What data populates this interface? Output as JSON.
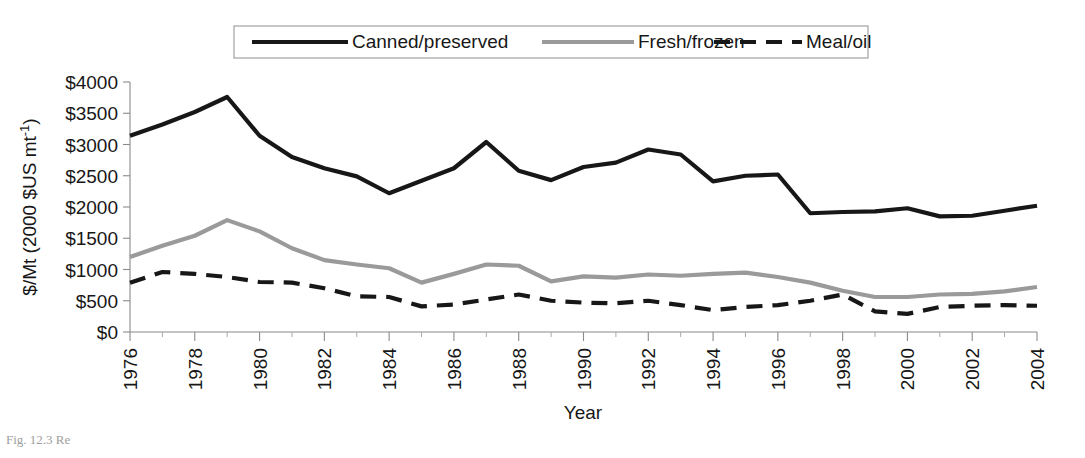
{
  "figure": {
    "caption_fragment": "Fig. 12.3  Re",
    "background": "#ffffff"
  },
  "chart_data": {
    "type": "line",
    "title": "",
    "xlabel": "Year",
    "ylabel": "$/Mt (2000 $US mt⁻¹)",
    "ylabel_parts": {
      "prefix": "$/Mt (2000 $US mt",
      "superscript": "-1",
      "suffix": ")"
    },
    "x": [
      1976,
      1977,
      1978,
      1979,
      1980,
      1981,
      1982,
      1983,
      1984,
      1985,
      1986,
      1987,
      1988,
      1989,
      1990,
      1991,
      1992,
      1993,
      1994,
      1995,
      1996,
      1997,
      1998,
      1999,
      2000,
      2001,
      2002,
      2003,
      2004
    ],
    "xlim": [
      1976,
      2004
    ],
    "ylim": [
      0,
      4000
    ],
    "yticks": [
      0,
      500,
      1000,
      1500,
      2000,
      2500,
      3000,
      3500,
      4000
    ],
    "ytick_labels": [
      "$0",
      "$500",
      "$1000",
      "$1500",
      "$2000",
      "$2500",
      "$3000",
      "$3500",
      "$4000"
    ],
    "xticks": [
      1976,
      1978,
      1980,
      1982,
      1984,
      1986,
      1988,
      1990,
      1992,
      1994,
      1996,
      1998,
      2000,
      2002,
      2004
    ],
    "xtick_labels": [
      "1976",
      "1978",
      "1980",
      "1982",
      "1984",
      "1986",
      "1988",
      "1990",
      "1992",
      "1994",
      "1996",
      "1998",
      "2000",
      "2002",
      "2004"
    ],
    "xtick_minor_step": 1,
    "grid": false,
    "legend_position": "top-center",
    "series": [
      {
        "name": "Canned/preserved",
        "color": "#171717",
        "width": 4.2,
        "dash": "none",
        "values": [
          3140,
          3320,
          3520,
          3760,
          3140,
          2800,
          2620,
          2490,
          2220,
          2420,
          2620,
          3040,
          2580,
          2430,
          2640,
          2710,
          2920,
          2840,
          2410,
          2500,
          2520,
          1900,
          1920,
          1930,
          1980,
          1850,
          1860,
          1940,
          2020
        ]
      },
      {
        "name": "Fresh/frozen",
        "color": "#9a9a9a",
        "width": 4.2,
        "dash": "none",
        "values": [
          1200,
          1380,
          1540,
          1790,
          1610,
          1340,
          1150,
          1080,
          1020,
          790,
          930,
          1080,
          1060,
          810,
          890,
          870,
          920,
          900,
          930,
          950,
          880,
          790,
          660,
          560,
          560,
          600,
          610,
          650,
          720
        ]
      },
      {
        "name": "Meal/oil",
        "color": "#171717",
        "width": 4.2,
        "dash": "16,10",
        "values": [
          790,
          960,
          930,
          880,
          800,
          790,
          700,
          570,
          560,
          410,
          440,
          520,
          600,
          500,
          470,
          460,
          500,
          430,
          350,
          400,
          430,
          500,
          600,
          330,
          290,
          400,
          420,
          430,
          420
        ]
      }
    ]
  },
  "layout": {
    "plot": {
      "left": 130,
      "right": 1037,
      "top": 82,
      "bottom": 332
    },
    "legend": {
      "x": 234,
      "y": 26,
      "width": 634,
      "height": 32
    }
  }
}
